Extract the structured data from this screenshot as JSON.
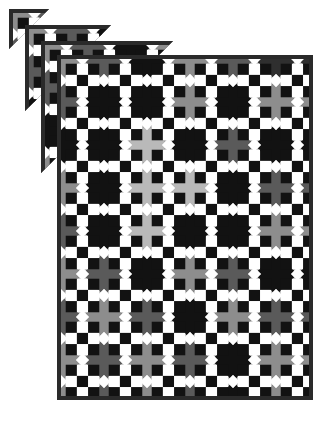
{
  "artwork": {
    "title": "Cascading Diagonal Checkerboard Quilt",
    "kind": "quilt-pattern-image",
    "background_color": "#ffffff",
    "canvas": {
      "width": 328,
      "height": 423
    }
  },
  "palette": {
    "white": "#ffffff",
    "near_white": "#f2f2f2",
    "light_gray": "#b9b9b9",
    "mid_gray": "#8d8d8d",
    "dark_gray": "#5a5a5a",
    "charcoal": "#2f2f2f",
    "black": "#121212",
    "border": "#2a2a2a"
  },
  "main_panel": {
    "x": 57,
    "y": 55,
    "width": 256,
    "height": 345,
    "border_color": "#2a2a2a",
    "border_width": 4,
    "background_color": "#1a1a1a",
    "grid": {
      "cols": 6,
      "rows": 8,
      "cell": 43
    },
    "block_types": [
      "nine-patch-diamond",
      "solid-diamond"
    ],
    "setting_colors": [
      "#121212",
      "#8d8d8d",
      "#5a5a5a",
      "#b9b9b9",
      "#2f2f2f"
    ],
    "diamond_frame_color": "#b9b9b9",
    "nine_patch_colors": [
      "#121212",
      "#ffffff"
    ],
    "corner_dot_color": "#ffffff",
    "setting_map": [
      [
        "#8d8d8d",
        "#5a5a5a",
        "#121212",
        "#8d8d8d",
        "#5a5a5a",
        "#2f2f2f"
      ],
      [
        "#5a5a5a",
        "#121212",
        "#121212",
        "#8d8d8d",
        "#121212",
        "#8d8d8d"
      ],
      [
        "#121212",
        "#121212",
        "#b9b9b9",
        "#121212",
        "#5a5a5a",
        "#121212"
      ],
      [
        "#8d8d8d",
        "#121212",
        "#b9b9b9",
        "#b9b9b9",
        "#121212",
        "#5a5a5a"
      ],
      [
        "#5a5a5a",
        "#121212",
        "#b9b9b9",
        "#121212",
        "#121212",
        "#8d8d8d"
      ],
      [
        "#8d8d8d",
        "#5a5a5a",
        "#121212",
        "#8d8d8d",
        "#5a5a5a",
        "#121212"
      ],
      [
        "#5a5a5a",
        "#8d8d8d",
        "#5a5a5a",
        "#121212",
        "#8d8d8d",
        "#5a5a5a"
      ],
      [
        "#8d8d8d",
        "#5a5a5a",
        "#8d8d8d",
        "#5a5a5a",
        "#121212",
        "#8d8d8d"
      ]
    ]
  },
  "cascade": {
    "count": 4,
    "description": "Four offset copies of the quilt clipped along a 45-degree diagonal, stacked toward the upper-left with white separating gaps.",
    "step_x": -16,
    "step_y": -16,
    "gap_color": "#ffffff",
    "layers": [
      {
        "index": 1,
        "x": 9,
        "y": 9,
        "clip_offset": 40
      },
      {
        "index": 2,
        "x": 25,
        "y": 25,
        "clip_offset": 86
      },
      {
        "index": 3,
        "x": 41,
        "y": 41,
        "clip_offset": 132
      },
      {
        "index": 4,
        "x": 57,
        "y": 55,
        "clip_offset": 400
      }
    ]
  }
}
